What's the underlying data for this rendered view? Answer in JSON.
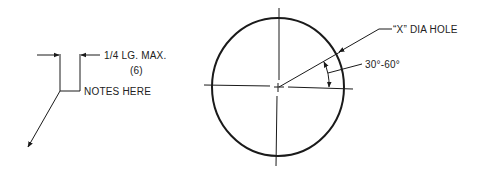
{
  "diagram": {
    "leader_note": {
      "dimension_label": "1/4 LG. MAX.",
      "dimension_metric": "(6)",
      "note_text": "NOTES HERE"
    },
    "hole_callout": {
      "hole_label": "“X” DIA HOLE",
      "angle_label": "30°-60°"
    },
    "colors": {
      "line": "#1a1a1a",
      "background": "#ffffff"
    }
  }
}
